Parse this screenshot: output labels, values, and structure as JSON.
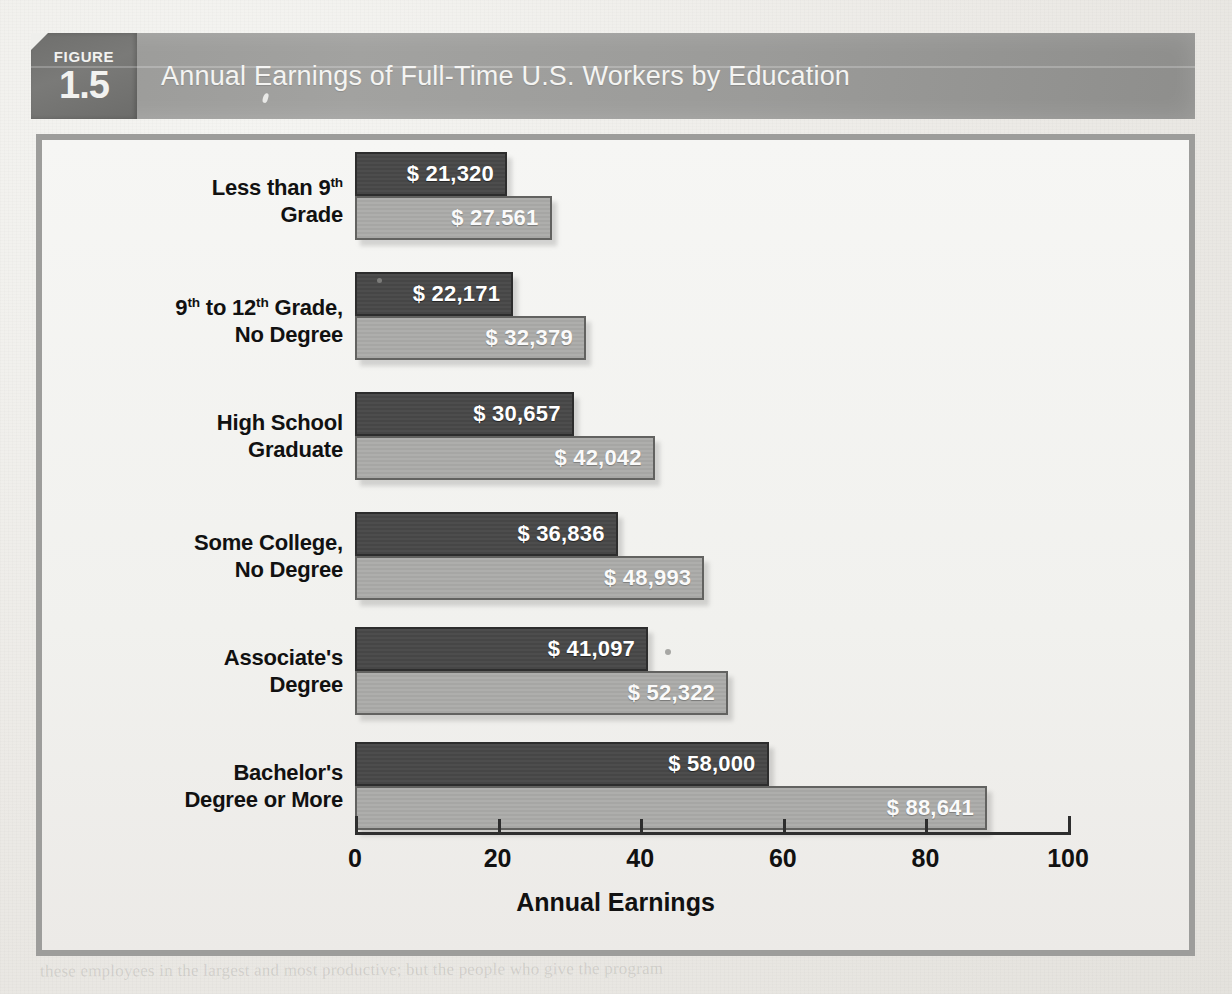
{
  "figure": {
    "badge_word": "FIGURE",
    "badge_number": "1.5",
    "title": "Annual Earnings of Full-Time U.S. Workers by Education"
  },
  "chart_data": {
    "type": "bar",
    "orientation": "horizontal",
    "title": "Annual Earnings of Full-Time U.S. Workers by Education",
    "xlabel": "Annual Earnings",
    "ylabel": "",
    "xlim": [
      0,
      100
    ],
    "xticks": [
      "0",
      "20",
      "40",
      "60",
      "80",
      "100"
    ],
    "xtick_values": [
      0,
      20,
      40,
      60,
      80,
      100
    ],
    "grid": false,
    "legend": "none",
    "units": "thousands of dollars",
    "categories": [
      "Less than 9th Grade",
      "9th to 12th Grade, No Degree",
      "High School Graduate",
      "Some College, No Degree",
      "Associate's Degree",
      "Bachelor's Degree or More"
    ],
    "series": [
      {
        "name": "lower",
        "color": "#4a4a4a",
        "values": [
          21.32,
          22.171,
          30.657,
          36.836,
          41.097,
          58.0
        ],
        "labels": [
          "$ 21,320",
          "$ 22,171",
          "$ 30,657",
          "$ 36,836",
          "$ 41,097",
          "$ 58,000"
        ]
      },
      {
        "name": "upper",
        "color": "#a8a8a6",
        "values": [
          27.561,
          32.379,
          42.042,
          48.993,
          52.322,
          88.641
        ],
        "labels": [
          "$ 27.561",
          "$ 32,379",
          "$ 42,042",
          "$ 48,993",
          "$ 52,322",
          "$ 88,641"
        ]
      }
    ]
  },
  "categories": [
    {
      "label_line1": "Less than 9",
      "label_sup1": "th",
      "label_line1_tail": "",
      "label_line2": "Grade",
      "dark_label": "$ 21,320",
      "light_label": "$ 27.561",
      "dark_value": 21.32,
      "light_value": 27.561
    },
    {
      "label_line1": "9",
      "label_sup1": "th",
      "label_line1_tail": " to 12",
      "label_sup2": "th",
      "label_line1_tail2": " Grade,",
      "label_line2": "No Degree",
      "dark_label": "$ 22,171",
      "light_label": "$ 32,379",
      "dark_value": 22.171,
      "light_value": 32.379
    },
    {
      "label_line1": "High School",
      "label_line2": "Graduate",
      "dark_label": "$ 30,657",
      "light_label": "$ 42,042",
      "dark_value": 30.657,
      "light_value": 42.042
    },
    {
      "label_line1": "Some College,",
      "label_line2": "No Degree",
      "dark_label": "$ 36,836",
      "light_label": "$ 48,993",
      "dark_value": 36.836,
      "light_value": 48.993
    },
    {
      "label_line1": "Associate's",
      "label_line2": "Degree",
      "dark_label": "$ 41,097",
      "light_label": "$ 52,322",
      "dark_value": 41.097,
      "light_value": 52.322
    },
    {
      "label_line1": "Bachelor's",
      "label_line2": "Degree or More",
      "dark_label": "$ 58,000",
      "light_label": "$ 88,641",
      "dark_value": 58.0,
      "light_value": 88.641
    }
  ],
  "axis": {
    "title": "Annual Earnings",
    "ticks": [
      "0",
      "20",
      "40",
      "60",
      "80",
      "100"
    ]
  },
  "colors": {
    "bar_dark": "#4a4a4a",
    "bar_light": "#a8a8a6",
    "banner": "#9b9b99",
    "badge": "#6f6f6d",
    "frame": "#9d9d9b",
    "page": "#efefec"
  },
  "ghost_text": {
    "right": "A among higher-income groups. In 1979 an average\nfull-time male high school graduate earned roughly\nthe average full-time male about 80 percent of what\nmore. Unfortunately, the data were gathered in ways\nthat was addressed in a far below market.\nIt is said that a 1982-1983 large, the differences could\nThe difference will be forever the matter has taken us.",
    "bottom": "these employees in the largest and most productive; but the people who give the program"
  }
}
